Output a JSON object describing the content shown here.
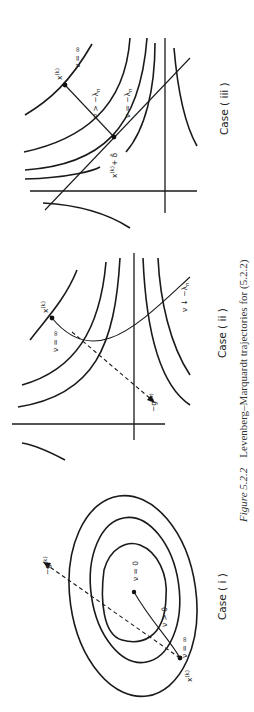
{
  "figure": {
    "number": "Figure 5.2.2",
    "caption": "Levenberg–Marquardt trajectories for (5.2.2)",
    "orientation": "rotated 90° counter-clockwise",
    "panels": [
      {
        "id": "case-i",
        "title": "Case ( i )",
        "labels": {
          "point": "x^(k)",
          "start": "ν = ∞",
          "mid": "ν > 0",
          "end": "ν = 0",
          "gradient": "−g^(k)"
        }
      },
      {
        "id": "case-ii",
        "title": "Case ( ii )",
        "labels": {
          "point": "x^(k)",
          "start": "ν = ∞",
          "end": "ν ↓ −λ_n",
          "gradient": "−g^(k)"
        }
      },
      {
        "id": "case-iii",
        "title": "Case ( iii )",
        "labels": {
          "point": "x^(k)",
          "start": "ν = ∞",
          "mid": "ν > −λ_n",
          "end": "ν = −λ_n",
          "asym": "x^(k) + δ̄"
        }
      }
    ]
  },
  "text": {
    "case_i": "Case ( i )",
    "case_ii": "Case ( ii )",
    "case_iii": "Case ( iii )",
    "fig_num": "Figure 5.2.2",
    "caption": "Levenberg–Marquardt trajectories for (5.2.2)",
    "x_k": "x",
    "k_sup": "(k)",
    "nu_inf": "ν = ∞",
    "nu_pos": "ν > 0",
    "nu_zero": "ν = 0",
    "neg_g": "−g",
    "nu_down": "ν ↓ −λ",
    "nu_gt": "ν > −λ",
    "nu_eq": "ν = −λ",
    "sub_n": "n",
    "x_plus_delta": "x",
    "plus_delta": "+ δ̄"
  }
}
